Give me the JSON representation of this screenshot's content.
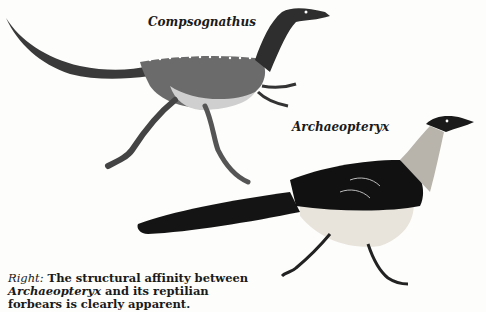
{
  "illustration": {
    "figures": [
      {
        "name": "Compsognathus",
        "label": "Compsognathus"
      },
      {
        "name": "Archaeopteryx",
        "label": "Archaeopteryx"
      }
    ]
  },
  "caption": {
    "lead": "Right:",
    "text_1": " The structural affinity between ",
    "genus": "Archaeopteryx",
    "text_2": " and its reptilian forbears is clearly apparent."
  },
  "colors": {
    "background": "#fdfdfb",
    "ink": "#1a1a1a"
  }
}
